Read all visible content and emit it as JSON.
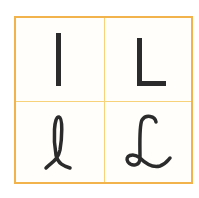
{
  "card": {
    "border_color": "#f2b24c",
    "divider_color": "#f7d27a",
    "background": "#fffefa",
    "ink_color": "#2b2b2b"
  },
  "cells": [
    {
      "position": "top-left",
      "glyph": "I",
      "style": "print-uppercase"
    },
    {
      "position": "top-right",
      "glyph": "L",
      "style": "print-uppercase"
    },
    {
      "position": "bottom-left",
      "glyph": "l",
      "style": "cursive-lowercase"
    },
    {
      "position": "bottom-right",
      "glyph": "L",
      "style": "cursive-uppercase"
    }
  ]
}
